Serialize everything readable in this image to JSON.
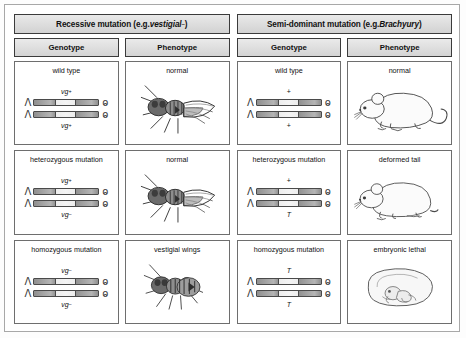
{
  "diagram": {
    "panels": [
      {
        "title_prefix": "Recessive mutation (e.g. ",
        "title_gene": "vestigial",
        "title_sup": "–",
        "title_suffix": ")",
        "columns": [
          "Genotype",
          "Phenotype"
        ],
        "rows": [
          {
            "genotype_label": "wild type",
            "allele_top": "vg",
            "allele_top_sup": "+",
            "allele_bottom": "vg",
            "allele_bottom_sup": "+",
            "phenotype_label": "normal",
            "phenotype_icon": "fly-normal-wings"
          },
          {
            "genotype_label": "heterozygous mutation",
            "allele_top": "vg",
            "allele_top_sup": "+",
            "allele_bottom": "vg",
            "allele_bottom_sup": "–",
            "phenotype_label": "normal",
            "phenotype_icon": "fly-normal-wings"
          },
          {
            "genotype_label": "homozygous mutation",
            "allele_top": "vg",
            "allele_top_sup": "–",
            "allele_bottom": "vg",
            "allele_bottom_sup": "–",
            "phenotype_label": "vestigial wings",
            "phenotype_icon": "fly-vestigial-wings"
          }
        ]
      },
      {
        "title_prefix": "Semi-dominant mutation (e.g. ",
        "title_gene": "Brachyury",
        "title_sup": "",
        "title_suffix": ")",
        "columns": [
          "Genotype",
          "Phenotype"
        ],
        "rows": [
          {
            "genotype_label": "wild type",
            "allele_top": "+",
            "allele_top_sup": "",
            "allele_bottom": "+",
            "allele_bottom_sup": "",
            "phenotype_label": "normal",
            "phenotype_icon": "mouse-long-tail"
          },
          {
            "genotype_label": "heterozygous mutation",
            "allele_top": "+",
            "allele_top_sup": "",
            "allele_bottom": "T",
            "allele_bottom_sup": "",
            "phenotype_label": "deformed tail",
            "phenotype_icon": "mouse-short-tail"
          },
          {
            "genotype_label": "homozygous mutation",
            "allele_top": "T",
            "allele_top_sup": "",
            "allele_bottom": "T",
            "allele_bottom_sup": "",
            "phenotype_label": "embryonic lethal",
            "phenotype_icon": "mouse-embryo"
          }
        ]
      }
    ],
    "colors": {
      "border": "#3b3b3b",
      "cell_border": "#6e6e6e",
      "header_fill": "#e0e0e0",
      "chromosome_dark": "#8f8f8f",
      "chromosome_light": "#f0f0f0"
    }
  }
}
